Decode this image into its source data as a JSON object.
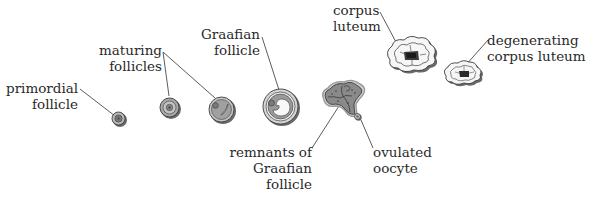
{
  "diagram": {
    "colors": {
      "outline": "#3a3a3a",
      "fill_mid": "#9a9a9a",
      "fill_light": "#c8c8c8",
      "fill_white": "#f4f4f4",
      "shadow": "#6a6a6a",
      "leader": "#4a4a4a",
      "text": "#2a2a2a"
    },
    "labels": {
      "primordial": {
        "line1": "primordial",
        "line2": "follicle"
      },
      "maturing": {
        "line1": "maturing",
        "line2": "follicles"
      },
      "graafian": {
        "line1": "Graafian",
        "line2": "follicle"
      },
      "remnants": {
        "line1": "remnants of",
        "line2": "Graafian",
        "line3": "follicle"
      },
      "ovulated": {
        "line1": "ovulated",
        "line2": "oocyte"
      },
      "corpus": {
        "line1": "corpus",
        "line2": "luteum"
      },
      "degenerating": {
        "line1": "degenerating",
        "line2": "corpus luteum"
      }
    }
  }
}
